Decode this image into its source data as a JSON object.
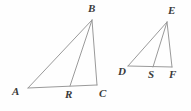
{
  "figure": {
    "background_color": "#fefefe",
    "line_color": "#9a9a9a",
    "label_color": "#3a3a3a",
    "width": 191,
    "height": 111,
    "shapes": [
      {
        "name": "triangle-abc",
        "vertices": [
          "A",
          "B",
          "C"
        ],
        "cevian": {
          "from": "B",
          "to": "R",
          "on_segment": "AC"
        }
      },
      {
        "name": "triangle-def",
        "vertices": [
          "D",
          "E",
          "F"
        ],
        "cevian": {
          "from": "E",
          "to": "S",
          "on_segment": "DF"
        }
      }
    ],
    "points": {
      "A": {
        "label": "A",
        "x": 28,
        "y": 88,
        "label_x": 12,
        "label_y": 86
      },
      "B": {
        "label": "B",
        "x": 92,
        "y": 20,
        "label_x": 88,
        "label_y": 3
      },
      "C": {
        "label": "C",
        "x": 97,
        "y": 85,
        "label_x": 99,
        "label_y": 88
      },
      "R": {
        "label": "R",
        "x": 70,
        "y": 86,
        "label_x": 65,
        "label_y": 89
      },
      "D": {
        "label": "D",
        "x": 128,
        "y": 66,
        "label_x": 118,
        "label_y": 66
      },
      "E": {
        "label": "E",
        "x": 167,
        "y": 22,
        "label_x": 168,
        "label_y": 5
      },
      "F": {
        "label": "F",
        "x": 172,
        "y": 67,
        "label_x": 169,
        "label_y": 69
      },
      "S": {
        "label": "S",
        "x": 153,
        "y": 67,
        "label_x": 148,
        "label_y": 69
      }
    },
    "segments": [
      {
        "name": "segment-ab",
        "from": "A",
        "to": "B"
      },
      {
        "name": "segment-ac",
        "from": "A",
        "to": "C"
      },
      {
        "name": "segment-bc",
        "from": "B",
        "to": "C"
      },
      {
        "name": "segment-br",
        "from": "B",
        "to": "R"
      },
      {
        "name": "segment-de",
        "from": "D",
        "to": "E"
      },
      {
        "name": "segment-df",
        "from": "D",
        "to": "F"
      },
      {
        "name": "segment-ef",
        "from": "E",
        "to": "F"
      },
      {
        "name": "segment-es",
        "from": "E",
        "to": "S"
      }
    ]
  }
}
